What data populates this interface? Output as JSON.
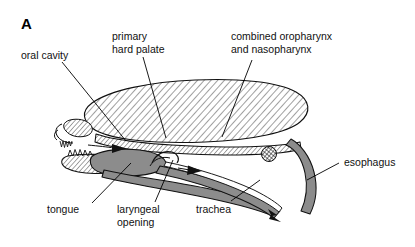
{
  "figure": {
    "panel_letter": "A",
    "background_color": "#ffffff",
    "ink_color": "#000000",
    "soft_tissue_fill": "#8c8c8c",
    "hatch_fill": "#ffffff",
    "hatch_stroke": "#1a1a1a"
  },
  "labels": {
    "oral_cavity": "oral cavity",
    "primary_hard_palate_line1": "primary",
    "primary_hard_palate_line2": "hard palate",
    "combined_pharynx_line1": "combined oropharynx",
    "combined_pharynx_line2": "and nasopharynx",
    "esophagus": "esophagus",
    "trachea": "trachea",
    "laryngeal_opening_line1": "laryngeal",
    "laryngeal_opening_line2": "opening",
    "tongue": "tongue"
  },
  "structures": [
    {
      "name": "oral-cavity",
      "label": "oral cavity",
      "style": "hatched"
    },
    {
      "name": "primary-hard-palate",
      "label": "primary hard palate",
      "style": "hatched-band"
    },
    {
      "name": "combined-oropharynx-nasopharynx",
      "label": "combined oropharynx and nasopharynx",
      "style": "hatched"
    },
    {
      "name": "esophagus",
      "label": "esophagus",
      "style": "solid-gray-tube"
    },
    {
      "name": "trachea",
      "label": "trachea",
      "style": "solid-gray-tube"
    },
    {
      "name": "laryngeal-opening",
      "label": "laryngeal opening",
      "style": "aperture"
    },
    {
      "name": "tongue",
      "label": "tongue",
      "style": "solid-gray-mass"
    }
  ],
  "arrows": [
    {
      "name": "airflow-arrow-upper",
      "direction": "right"
    },
    {
      "name": "airflow-arrow-middle",
      "direction": "right"
    },
    {
      "name": "airflow-arrow-lower",
      "direction": "down-right"
    }
  ]
}
